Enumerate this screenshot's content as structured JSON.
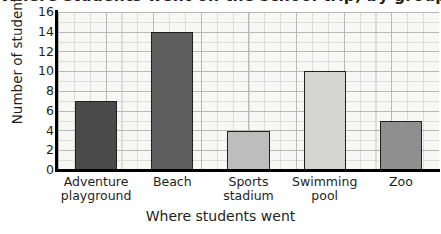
{
  "chart_data": {
    "type": "bar",
    "title": "Where students went on the school trip, by group",
    "xlabel": "Where students went",
    "ylabel": "Number of students",
    "categories": [
      "Adventure playground",
      "Beach",
      "Sports stadium",
      "Swimming pool",
      "Zoo"
    ],
    "category_lines": [
      [
        "Adventure",
        "playground"
      ],
      [
        "Beach"
      ],
      [
        "Sports",
        "stadium"
      ],
      [
        "Swimming",
        "pool"
      ],
      [
        "Zoo"
      ]
    ],
    "values": [
      7,
      14,
      4,
      10,
      5
    ],
    "bar_colors": [
      "#4a4a4a",
      "#5e5e5e",
      "#bdbdbd",
      "#d4d4d2",
      "#8f8f8f"
    ],
    "bar_edge_color": "#231f20",
    "ylim": [
      0,
      16
    ],
    "ytick_labels": [
      "0",
      "2",
      "4",
      "6",
      "8",
      "10",
      "12",
      "14",
      "16"
    ],
    "ytick_values": [
      0,
      2,
      4,
      6,
      8,
      10,
      12,
      14,
      16
    ],
    "grid": "major and minor gridlines, graph-paper style",
    "legend": "none",
    "plot_background": "#f7f7f5",
    "axis_color": "#000000"
  }
}
